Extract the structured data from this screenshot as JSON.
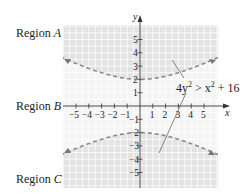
{
  "regions": {
    "a": {
      "prefix": "Region ",
      "letter": "A"
    },
    "b": {
      "prefix": "Region ",
      "letter": "B"
    },
    "c": {
      "prefix": "Region ",
      "letter": "C"
    }
  },
  "annotation": {
    "coef": "4y",
    "exp1": "2",
    "op": " > x",
    "exp2": "2",
    "rest": " + 16"
  },
  "colors": {
    "shade": "#e6e6e6",
    "grid": "#ffffff",
    "curve": "#888888",
    "axis": "#333333"
  },
  "chart_data": {
    "type": "line",
    "title": "",
    "xlabel": "x",
    "ylabel": "y",
    "xlim": [
      -5.8,
      6
    ],
    "ylim": [
      -6,
      6
    ],
    "x_ticks": [
      -5,
      -4,
      -3,
      -2,
      -1,
      1,
      2,
      3,
      4,
      5
    ],
    "y_ticks": [
      -5,
      -4,
      -3,
      -2,
      -1,
      1,
      2,
      3,
      4,
      5
    ],
    "grid": true,
    "inequality": "4y^2 > x^2 + 16",
    "boundary": "hyperbola y^2/4 - x^2/16 = 1 (dashed)",
    "series": [
      {
        "name": "upper branch",
        "x": [
          -5.8,
          -4,
          -2,
          0,
          2,
          4,
          6
        ],
        "y": [
          3.52,
          2.83,
          2.24,
          2.0,
          2.24,
          2.83,
          3.61
        ]
      },
      {
        "name": "lower branch",
        "x": [
          -5.8,
          -4,
          -2,
          0,
          2,
          4,
          6
        ],
        "y": [
          -3.52,
          -2.83,
          -2.24,
          -2.0,
          -2.24,
          -2.83,
          -3.61
        ]
      }
    ],
    "shaded_regions": [
      "Region A (above upper branch)",
      "Region C (below lower branch)"
    ],
    "region_labels": [
      "Region A",
      "Region B",
      "Region C"
    ]
  }
}
